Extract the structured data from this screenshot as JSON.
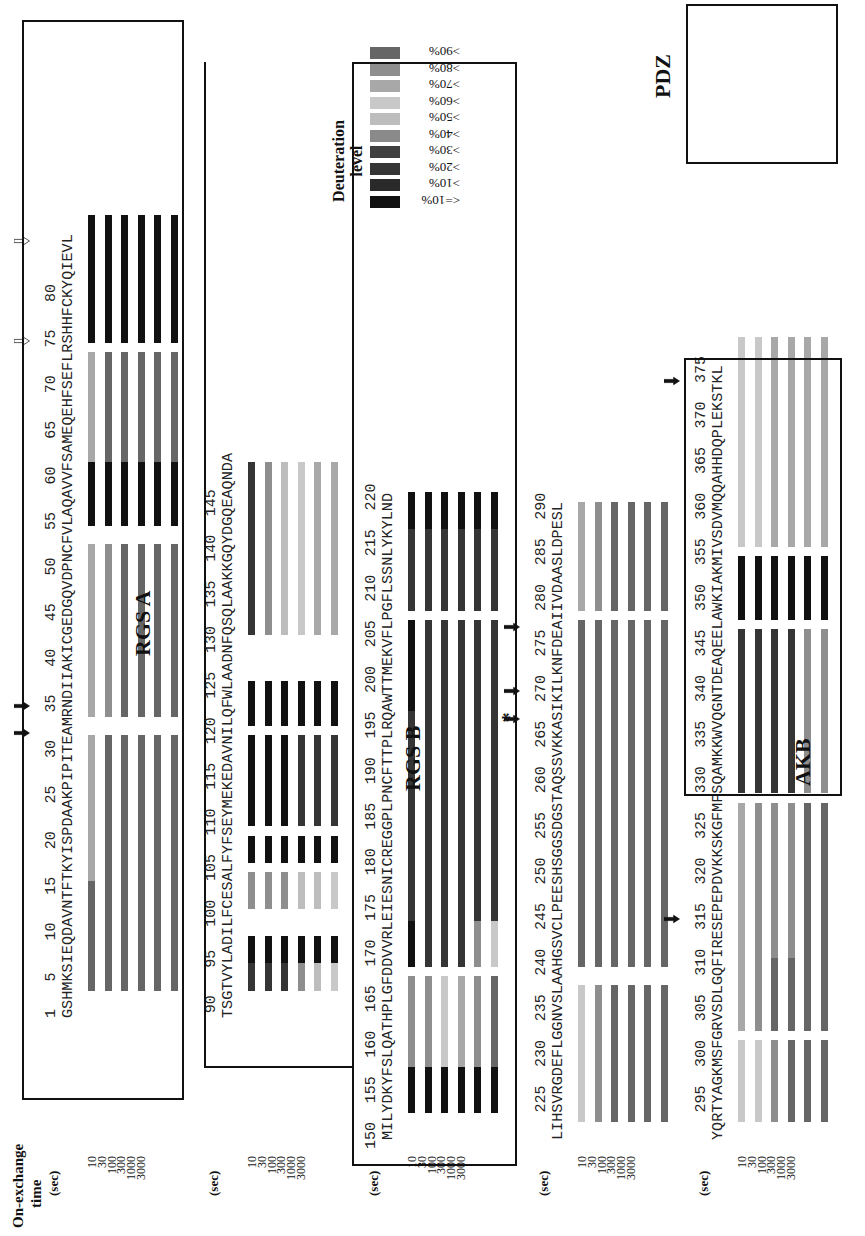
{
  "figure": {
    "orientation": "rotated 90 degrees counter-clockwise",
    "header": {
      "line1": "On-exchange",
      "line2": "time",
      "unit": "(sec)"
    },
    "time_points": [
      "10",
      "30",
      "100",
      "300",
      "1000",
      "3000"
    ],
    "legend": {
      "title_line1": "Deuteration",
      "title_line2": "level",
      "levels": [
        {
          "label": "<=10%",
          "color": "#111111"
        },
        {
          "label": ">10%",
          "color": "#2a2a2a"
        },
        {
          "label": ">20%",
          "color": "#353535"
        },
        {
          "label": ">30%",
          "color": "#404040"
        },
        {
          "label": ">40%",
          "color": "#8a8a8a"
        },
        {
          "label": ">50%",
          "color": "#bdbdbd"
        },
        {
          "label": ">60%",
          "color": "#c8c8c8"
        },
        {
          "label": ">70%",
          "color": "#a8a8a8"
        },
        {
          "label": ">80%",
          "color": "#8e8e8e"
        },
        {
          "label": ">90%",
          "color": "#666666"
        }
      ]
    },
    "domains": [
      {
        "label": "RGS A"
      },
      {
        "label": "RGS B"
      },
      {
        "label": "AKB"
      },
      {
        "label": "PDZ"
      }
    ],
    "rows": [
      {
        "start": 1,
        "sequence": "GSHMKSIEQDAVNTFTKYISPDAAKPIPITEAMRNDIIAKICGEDGQVDPNCFVLAQAVVFSAMEQEHFSEFLRSHHFCKYQIEVL",
        "ticks": [
          "1",
          "5",
          "10",
          "15",
          "20",
          "25",
          "30",
          "35",
          "40",
          "45",
          "50",
          "55",
          "60",
          "65",
          "70",
          "75",
          "80"
        ],
        "segments": [
          {
            "from": 4,
            "to": 15,
            "levels": [
              ">90%",
              ">90%",
              ">90%",
              ">90%",
              ">90%",
              ">90%"
            ]
          },
          {
            "from": 16,
            "to": 31,
            "levels": [
              ">70%",
              ">90%",
              ">90%",
              ">90%",
              ">90%",
              ">90%"
            ]
          },
          {
            "from": 34,
            "to": 52,
            "levels": [
              ">70%",
              ">80%",
              ">90%",
              ">90%",
              ">90%",
              ">90%"
            ]
          },
          {
            "from": 55,
            "to": 61,
            "levels": [
              "<=10%",
              "<=10%",
              "<=10%",
              "<=10%",
              "<=10%",
              "<=10%"
            ]
          },
          {
            "from": 62,
            "to": 73,
            "levels": [
              ">70%",
              ">90%",
              ">90%",
              ">90%",
              ">90%",
              ">90%"
            ]
          },
          {
            "from": 75,
            "to": 88,
            "levels": [
              "<=10%",
              "<=10%",
              "<=10%",
              "<=10%",
              "<=10%",
              "<=10%"
            ]
          }
        ]
      },
      {
        "start": 89,
        "sequence": "TSGTVYLADILFCESALFYFSEYMEKEDAVNILQFWLAADNFQSQLAAKKGQYDGQEAQNDA",
        "ticks": [
          "90",
          "95",
          "100",
          "105",
          "110",
          "115",
          "120",
          "125",
          "130",
          "135",
          "140",
          "145"
        ],
        "segments": [
          {
            "from": 92,
            "to": 94,
            "levels": [
              ">20%",
              ">20%",
              ">20%",
              ">80%",
              ">50%",
              ">60%"
            ]
          },
          {
            "from": 95,
            "to": 97,
            "levels": [
              "<=10%",
              "<=10%",
              "<=10%",
              "<=10%",
              "<=10%",
              "<=10%"
            ]
          },
          {
            "from": 101,
            "to": 104,
            "levels": [
              ">80%",
              ">80%",
              ">80%",
              ">50%",
              ">50%",
              ">60%"
            ]
          },
          {
            "from": 106,
            "to": 108,
            "levels": [
              "<=10%",
              "<=10%",
              "<=10%",
              "<=10%",
              "<=10%",
              "<=10%"
            ]
          },
          {
            "from": 110,
            "to": 119,
            "levels": [
              "<=10%",
              "<=10%",
              "<=10%",
              ">20%",
              ">20%",
              ">20%"
            ]
          },
          {
            "from": 121,
            "to": 125,
            "levels": [
              "<=10%",
              "<=10%",
              "<=10%",
              "<=10%",
              "<=10%",
              "<=10%"
            ]
          },
          {
            "from": 131,
            "to": 149,
            "levels": [
              ">20%",
              ">80%",
              ">50%",
              ">60%",
              ">70%",
              ">70%"
            ]
          }
        ]
      },
      {
        "start": 150,
        "sequence": "MILYDKYFSLQATHPLGFDDVVRLEIESNICREGGPLPNCFTTPLRQAWTTMEKVFLPGFLSSNLYKYLND",
        "ticks": [
          "150",
          "155",
          "160",
          "165",
          "170",
          "175",
          "180",
          "185",
          "190",
          "195",
          "200",
          "205",
          "210",
          "215",
          "220"
        ],
        "segments": [
          {
            "from": 153,
            "to": 157,
            "levels": [
              "<=10%",
              "<=10%",
              "<=10%",
              "<=10%",
              "<=10%",
              "<=10%"
            ]
          },
          {
            "from": 158,
            "to": 167,
            "levels": [
              ">80%",
              ">80%",
              ">60%",
              ">70%",
              ">80%",
              ">90%"
            ]
          },
          {
            "from": 169,
            "to": 173,
            "levels": [
              "<=10%",
              ">20%",
              ">20%",
              ">20%",
              ">80%",
              ">60%"
            ]
          },
          {
            "from": 174,
            "to": 185,
            "levels": [
              ">20%",
              ">20%",
              ">20%",
              ">20%",
              ">20%",
              ">20%"
            ]
          },
          {
            "from": 186,
            "to": 196,
            "levels": [
              ">20%",
              ">20%",
              ">20%",
              ">20%",
              ">20%",
              ">20%"
            ]
          },
          {
            "from": 197,
            "to": 206,
            "levels": [
              "<=10%",
              ">20%",
              ">20%",
              ">20%",
              ">20%",
              ">20%"
            ]
          },
          {
            "from": 208,
            "to": 216,
            "levels": [
              ">20%",
              ">20%",
              ">20%",
              ">20%",
              ">20%",
              ">20%"
            ]
          },
          {
            "from": 217,
            "to": 220,
            "levels": [
              "<=10%",
              "<=10%",
              "<=10%",
              "<=10%",
              "<=10%",
              "<=10%"
            ]
          }
        ]
      },
      {
        "start": 221,
        "sequence": "LIHSVRGDEFLGGNVSLAAHGSVCLPEESHSGGSDGSTAQSSVKKASIKILKNFDEAIIVDAASLDPESL",
        "ticks": [
          "225",
          "230",
          "235",
          "240",
          "245",
          "250",
          "255",
          "260",
          "265",
          "270",
          "275",
          "280",
          "285",
          "290"
        ],
        "segments": [
          {
            "from": 223,
            "to": 237,
            "levels": [
              ">60%",
              ">80%",
              ">90%",
              ">90%",
              ">90%",
              ">90%"
            ]
          },
          {
            "from": 240,
            "to": 277,
            "levels": [
              ">90%",
              ">90%",
              ">90%",
              ">90%",
              ">90%",
              ">90%"
            ]
          },
          {
            "from": 279,
            "to": 290,
            "levels": [
              ">70%",
              ">80%",
              ">90%",
              ">90%",
              ">90%",
              ">90%"
            ]
          }
        ]
      },
      {
        "start": 291,
        "sequence": "YQRTYAGKMSFGRVSDLGQFIRESEPEPDVKKSKGFMFSQAMKKWVQGNTDEAQEELAWKIAKMIVSDVMQQAHHDQPLEKSTKL",
        "ticks": [
          "295",
          "300",
          "305",
          "310",
          "315",
          "320",
          "325",
          "330",
          "335",
          "340",
          "345",
          "350",
          "355",
          "360",
          "365",
          "370",
          "375"
        ],
        "segments": [
          {
            "from": 293,
            "to": 301,
            "levels": [
              ">60%",
              ">60%",
              ">80%",
              ">90%",
              ">90%",
              ">90%"
            ]
          },
          {
            "from": 303,
            "to": 310,
            "levels": [
              ">70%",
              ">80%",
              ">90%",
              ">90%",
              ">90%",
              ">90%"
            ]
          },
          {
            "from": 311,
            "to": 327,
            "levels": [
              ">70%",
              ">80%",
              ">80%",
              ">80%",
              ">90%",
              ">90%"
            ]
          },
          {
            "from": 329,
            "to": 346,
            "levels": [
              ">20%",
              ">20%",
              ">20%",
              ">20%",
              ">80%",
              ">80%"
            ]
          },
          {
            "from": 348,
            "to": 354,
            "levels": [
              "<=10%",
              "<=10%",
              "<=10%",
              "<=10%",
              "<=10%",
              "<=10%"
            ]
          },
          {
            "from": 356,
            "to": 378,
            "levels": [
              ">60%",
              ">60%",
              ">70%",
              ">70%",
              ">70%",
              ">70%"
            ]
          }
        ]
      }
    ],
    "annotations": {
      "filled_arrows": [
        31,
        34,
        266,
        269,
        276,
        314,
        373
      ],
      "open_arrows": [
        74,
        85
      ],
      "asterisk_residue": 267,
      "asterisk": "*"
    }
  }
}
